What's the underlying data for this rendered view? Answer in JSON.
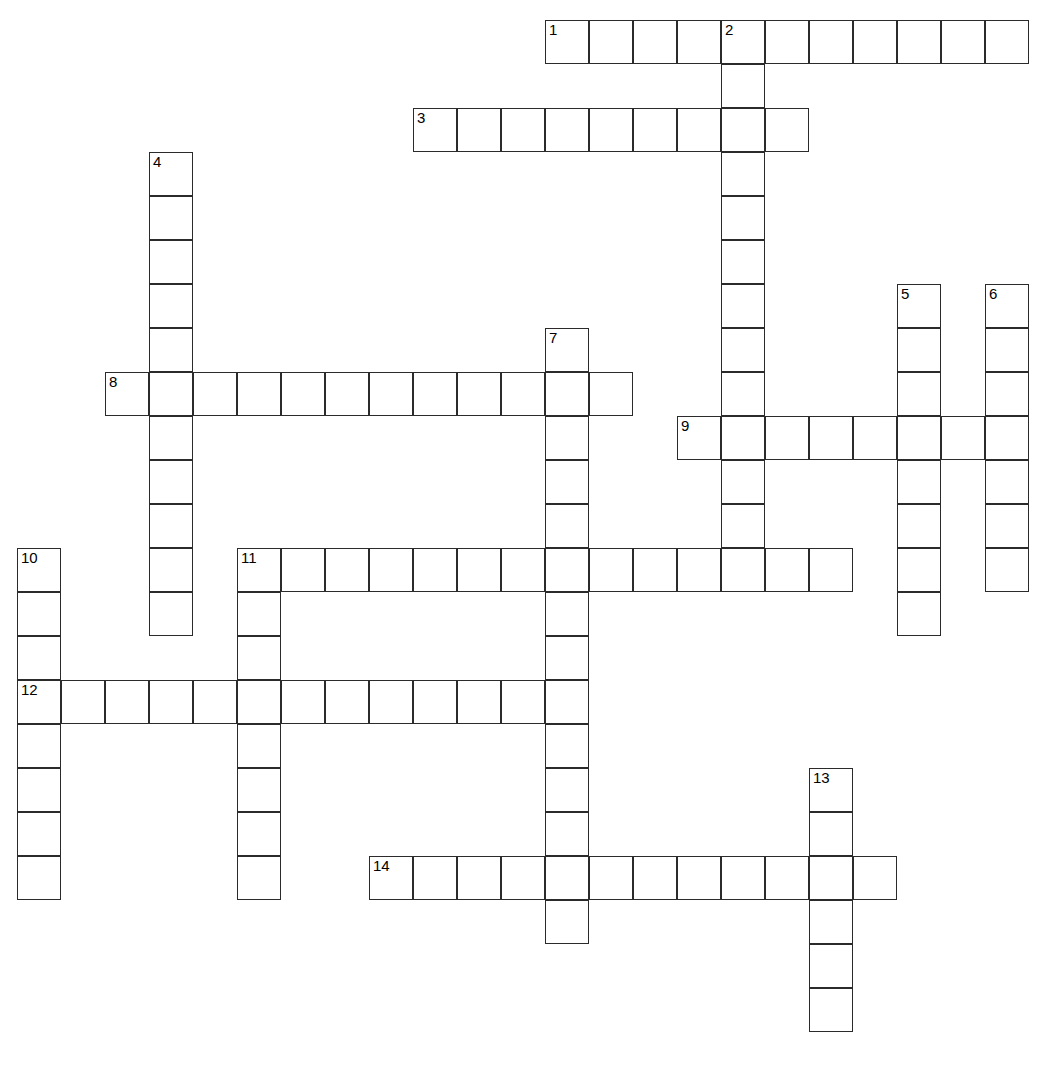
{
  "puzzle": {
    "title": "Crossword Puzzle Grid",
    "type": "crossword-grid",
    "canvas": {
      "width": 1038,
      "height": 1079
    },
    "cell_size": 44,
    "origin": {
      "x": 17,
      "y": 20
    },
    "colors": {
      "grid_line": "#2b2b2b",
      "cell_fill": "#ffffff",
      "background": "#ffffff",
      "number_text": "#000000"
    },
    "columns_count": 23,
    "rows_count": 24,
    "entries": [
      {
        "number": "1",
        "direction": "across",
        "col": 12,
        "row": 0,
        "length": 11
      },
      {
        "number": "2",
        "direction": "down",
        "col": 16,
        "row": 0,
        "length": 13
      },
      {
        "number": "3",
        "direction": "across",
        "col": 9,
        "row": 2,
        "length": 9
      },
      {
        "number": "4",
        "direction": "down",
        "col": 3,
        "row": 3,
        "length": 11
      },
      {
        "number": "5",
        "direction": "down",
        "col": 20,
        "row": 6,
        "length": 8
      },
      {
        "number": "6",
        "direction": "down",
        "col": 22,
        "row": 6,
        "length": 7
      },
      {
        "number": "7",
        "direction": "down",
        "col": 12,
        "row": 7,
        "length": 14
      },
      {
        "number": "8",
        "direction": "across",
        "col": 2,
        "row": 8,
        "length": 12
      },
      {
        "number": "9",
        "direction": "across",
        "col": 15,
        "row": 9,
        "length": 8
      },
      {
        "number": "10",
        "direction": "down",
        "col": 0,
        "row": 12,
        "length": 8
      },
      {
        "number": "11",
        "direction": "across",
        "col": 5,
        "row": 12,
        "length": 14
      },
      {
        "number": "11",
        "direction": "down",
        "col": 5,
        "row": 12,
        "length": 8
      },
      {
        "number": "12",
        "direction": "across",
        "col": 0,
        "row": 15,
        "length": 13
      },
      {
        "number": "13",
        "direction": "down",
        "col": 18,
        "row": 17,
        "length": 6
      },
      {
        "number": "14",
        "direction": "across",
        "col": 8,
        "row": 19,
        "length": 12
      }
    ],
    "clue_numbers": [
      "1",
      "2",
      "3",
      "4",
      "5",
      "6",
      "7",
      "8",
      "9",
      "10",
      "11",
      "12",
      "13",
      "14"
    ]
  }
}
